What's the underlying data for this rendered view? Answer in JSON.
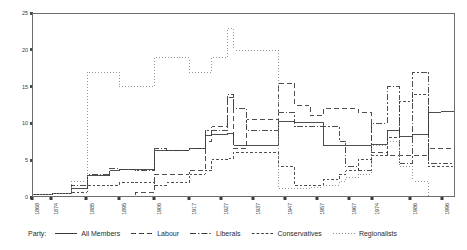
{
  "chart_data": {
    "type": "line",
    "title": "",
    "subtitle": "",
    "xlabel": "",
    "ylabel": "",
    "xlim": [
      1868,
      2000
    ],
    "ylim": [
      0,
      25
    ],
    "grid": false,
    "legend_position": "bottom",
    "step": "post",
    "yticks": [
      0,
      5,
      10,
      15,
      20,
      25
    ],
    "ytick_labels": [
      "0",
      "5",
      "10",
      "15",
      "20",
      "25"
    ],
    "xticks": [
      1868,
      1874,
      1885,
      1895,
      1906,
      1917,
      1927,
      1937,
      1947,
      1957,
      1967,
      1974,
      1986,
      1996
    ],
    "xtick_labels": [
      "1868",
      "1874",
      "1885",
      "1895",
      "1906",
      "1917",
      "1927",
      "1937",
      "1947",
      "1957",
      "1967",
      "1974",
      "1986",
      "1996"
    ],
    "legend_title": "Party:",
    "series": [
      {
        "name": "All Members",
        "style": "solid",
        "color": "#3a3a3a",
        "x": [
          1868,
          1874,
          1880,
          1885,
          1892,
          1895,
          1900,
          1906,
          1910,
          1917,
          1922,
          1924,
          1929,
          1931,
          1935,
          1945,
          1950,
          1955,
          1959,
          1964,
          1966,
          1970,
          1974,
          1979,
          1983,
          1987,
          1992,
          1996
        ],
        "y": [
          0.2,
          0.3,
          1.0,
          2.8,
          3.5,
          3.6,
          3.6,
          6.2,
          6.3,
          6.5,
          8.3,
          8.5,
          8.6,
          7.0,
          7.0,
          10.2,
          10.1,
          10.1,
          7.0,
          7.0,
          7.0,
          7.0,
          7.1,
          9.0,
          8.2,
          8.5,
          11.5,
          11.6
        ]
      },
      {
        "name": "Labour",
        "style": "dashed",
        "color": "#3a3a3a",
        "x": [
          1868,
          1900,
          1906,
          1910,
          1917,
          1922,
          1924,
          1929,
          1931,
          1935,
          1945,
          1950,
          1955,
          1959,
          1964,
          1966,
          1970,
          1974,
          1979,
          1983,
          1987,
          1992,
          1996
        ],
        "y": [
          0.0,
          0.5,
          3.0,
          3.0,
          3.5,
          7.5,
          9.5,
          13.5,
          6.5,
          10.5,
          15.5,
          12.5,
          11.0,
          12.0,
          12.0,
          12.0,
          11.5,
          6.0,
          5.5,
          5.5,
          5.5,
          6.5,
          6.5
        ]
      },
      {
        "name": "Liberals",
        "style": "dash-dot",
        "color": "#3a3a3a",
        "x": [
          1868,
          1874,
          1880,
          1885,
          1892,
          1895,
          1900,
          1906,
          1910,
          1917,
          1922,
          1924,
          1929,
          1931,
          1935,
          1945,
          1950,
          1955,
          1959,
          1964,
          1966,
          1970,
          1974,
          1979,
          1983,
          1987,
          1992,
          1996
        ],
        "y": [
          0.2,
          0.3,
          1.5,
          3.0,
          3.8,
          3.6,
          3.5,
          6.5,
          6.3,
          6.5,
          9.0,
          9.0,
          14.0,
          12.0,
          9.0,
          11.5,
          9.5,
          9.5,
          9.5,
          7.5,
          4.0,
          3.5,
          10.0,
          15.0,
          4.5,
          17.0,
          4.5,
          4.5
        ]
      },
      {
        "name": "Conservatives",
        "style": "small-dash",
        "color": "#3a3a3a",
        "x": [
          1868,
          1874,
          1880,
          1885,
          1892,
          1895,
          1900,
          1906,
          1910,
          1917,
          1922,
          1924,
          1929,
          1931,
          1935,
          1945,
          1950,
          1955,
          1959,
          1964,
          1966,
          1970,
          1974,
          1979,
          1983,
          1987,
          1992,
          1996
        ],
        "y": [
          0.2,
          0.4,
          0.5,
          1.4,
          1.5,
          1.8,
          1.9,
          1.5,
          1.8,
          3.0,
          3.5,
          5.0,
          5.2,
          6.0,
          6.0,
          4.0,
          1.5,
          1.5,
          2.2,
          3.0,
          3.5,
          5.0,
          5.5,
          8.0,
          13.0,
          14.0,
          4.0,
          4.0
        ]
      },
      {
        "name": "Regionalists",
        "style": "dotted",
        "color": "#8a8a8a",
        "x": [
          1868,
          1874,
          1880,
          1885,
          1892,
          1895,
          1900,
          1906,
          1910,
          1917,
          1922,
          1924,
          1929,
          1931,
          1935,
          1945,
          1950,
          1955,
          1959,
          1964,
          1966,
          1970,
          1974,
          1979,
          1983,
          1987,
          1992,
          1996
        ],
        "y": [
          0.2,
          0.3,
          2.0,
          17.0,
          17.0,
          15.0,
          15.0,
          19.0,
          19.0,
          17.0,
          17.0,
          19.0,
          23.0,
          20.0,
          20.0,
          1.0,
          1.0,
          1.2,
          1.5,
          2.0,
          2.5,
          3.0,
          7.0,
          7.5,
          4.0,
          2.0,
          0.0,
          0.0
        ]
      }
    ]
  }
}
